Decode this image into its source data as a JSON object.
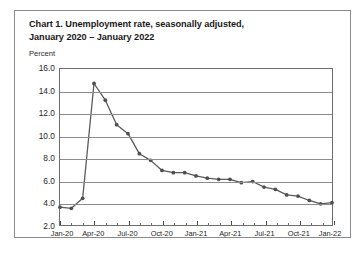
{
  "chart_data": {
    "type": "line",
    "title": "Chart 1. Unemployment rate, seasonally adjusted, January 2020 – January 2022",
    "title_lines": [
      "Chart 1. Unemployment rate, seasonally adjusted,",
      "January 2020 – January 2022"
    ],
    "ylabel": "Percent",
    "xlabel": "",
    "ylim": [
      2.0,
      16.0
    ],
    "yticks": [
      2.0,
      4.0,
      6.0,
      8.0,
      10.0,
      12.0,
      14.0,
      16.0
    ],
    "ytick_labels": [
      "2.0",
      "4.0",
      "6.0",
      "8.0",
      "10.0",
      "12.0",
      "14.0",
      "16.0"
    ],
    "grid": true,
    "legend": "none",
    "line_color": "#5a5a5a",
    "marker": "circle",
    "x": [
      "Jan-20",
      "Feb-20",
      "Mar-20",
      "Apr-20",
      "May-20",
      "Jun-20",
      "Jul-20",
      "Aug-20",
      "Sep-20",
      "Oct-20",
      "Nov-20",
      "Dec-20",
      "Jan-21",
      "Feb-21",
      "Mar-21",
      "Apr-21",
      "May-21",
      "Jun-21",
      "Jul-21",
      "Aug-21",
      "Sep-21",
      "Oct-21",
      "Nov-21",
      "Dec-21",
      "Jan-22"
    ],
    "values": [
      3.6,
      3.5,
      4.4,
      14.7,
      13.2,
      11.0,
      10.2,
      8.4,
      7.8,
      6.9,
      6.7,
      6.7,
      6.4,
      6.2,
      6.1,
      6.1,
      5.8,
      5.9,
      5.4,
      5.2,
      4.7,
      4.6,
      4.2,
      3.9,
      4.0
    ],
    "xtick_labels": [
      "Jan-20",
      "Apr-20",
      "Jul-20",
      "Oct-20",
      "Jan-21",
      "Apr-21",
      "Jul-21",
      "Oct-21",
      "Jan-22"
    ],
    "xtick_indices": [
      0,
      3,
      6,
      9,
      12,
      15,
      18,
      21,
      24
    ]
  }
}
